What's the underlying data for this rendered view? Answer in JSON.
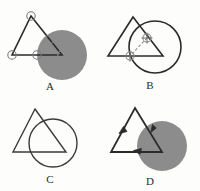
{
  "figure": {
    "background_color": "#fdfdfc",
    "panel_count": 4,
    "stroke_color": "#2b2b2b",
    "shaded_fill_color": "#8c8c8c",
    "marker_stroke_color": "#6e6e6e",
    "panels": [
      {
        "id": "a",
        "label": "A",
        "triangle_filled": false,
        "circle_shaded": true,
        "markers": "open-circles",
        "marker_count": 5,
        "description": "Triangle outline with open circle markers at vertices and edge intersections over a shaded circle"
      },
      {
        "id": "b",
        "label": "B",
        "triangle_filled": false,
        "circle_shaded": false,
        "markers": "crosshairs",
        "marker_count": 2,
        "dashed_chord": true,
        "description": "Triangle outline and circle outline with crosshair markers at the two intersection points joined by a dashed chord"
      },
      {
        "id": "c",
        "label": "C",
        "triangle_filled": false,
        "circle_shaded": false,
        "markers": "none",
        "marker_count": 0,
        "description": "Plain triangle outline overlapping a plain circle outline"
      },
      {
        "id": "d",
        "label": "D",
        "triangle_filled": false,
        "circle_shaded": true,
        "markers": "arrowheads",
        "marker_count": 3,
        "description": "Triangle outline with directional arrowheads on each edge over a shaded circle"
      }
    ]
  }
}
